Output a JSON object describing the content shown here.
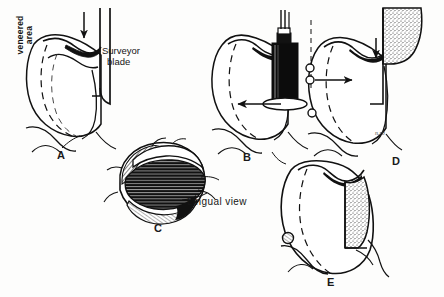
{
  "figure": {
    "width": 444,
    "height": 297,
    "background_color": "#fdfdfc",
    "ink_color": "#111111"
  },
  "labels": {
    "veneered_area_line1": "veneered",
    "veneered_area_line2": "area",
    "surveyor_blade_line1": "Surveyor",
    "surveyor_blade_line2": "blade",
    "lingual_view": "Lingual  view",
    "artist_signature": "n.rb"
  },
  "panels": [
    {
      "id": "A",
      "letter": "A",
      "caption": "Tooth with veneered area and surveyor blade contacting the lingual surface, downward arrow indicating blade travel",
      "annotations": [
        "veneered area",
        "Surveyor blade"
      ]
    },
    {
      "id": "B",
      "letter": "B",
      "caption": "Handpiece with bur positioned against the tooth, horizontal arrow indicating direction of movement",
      "annotations": []
    },
    {
      "id": "C",
      "letter": "C",
      "caption": "Occlusal drawing of the tooth shown from the lingual aspect with hatched and solid shaded zones",
      "annotations": [
        "Lingual view"
      ]
    },
    {
      "id": "D",
      "letter": "D",
      "caption": "Tooth against the surveyor blade with stippled blade face, circles marking reference points and arrows showing approach",
      "annotations": []
    },
    {
      "id": "E",
      "letter": "E",
      "caption": "Completed tooth preparation with stippled veneered surface and small circular ledge on the opposite side",
      "annotations": []
    }
  ],
  "icons": {
    "arrow_down": "arrow-down-icon",
    "arrow_left": "arrow-left-icon",
    "arrow_right": "arrow-right-icon"
  }
}
